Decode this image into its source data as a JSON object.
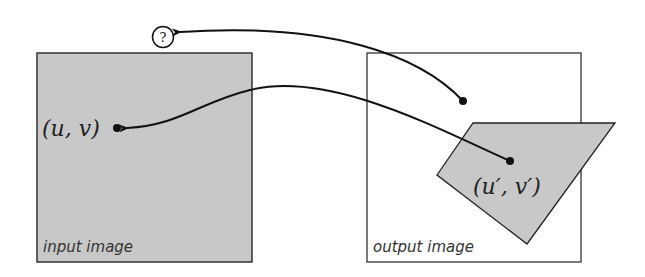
{
  "diagram": {
    "input_image": {
      "label": "input image",
      "fill": "#c8c8c8",
      "point_label": "(u, v)"
    },
    "output_image": {
      "label": "output image",
      "fill": "#ffffff",
      "point_label": "(u′, v′)"
    },
    "unknown_marker": "?",
    "colors": {
      "stroke": "#111111",
      "gray_fill": "#c8c8c8"
    }
  }
}
